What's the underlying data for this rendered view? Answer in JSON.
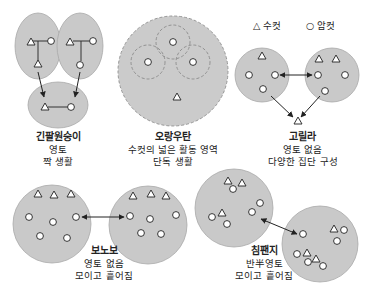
{
  "legend": {
    "male_symbol": "△",
    "male_label": "수컷",
    "female_symbol": "○",
    "female_label": "암컷"
  },
  "species": [
    {
      "name": "긴팔원숭이",
      "desc_line1": "영토",
      "desc_line2": "짝 생활"
    },
    {
      "name": "오랑우탄",
      "desc_line1": "수컷의 넓은 활동 영역",
      "desc_line2": "단독 생활"
    },
    {
      "name": "고릴라",
      "desc_line1": "영토 없음",
      "desc_line2": "다양한 집단 구성"
    },
    {
      "name": "보노보",
      "desc_line1": "영토 없음",
      "desc_line2": "모이고 흩어짐"
    },
    {
      "name": "침팬지",
      "desc_line1": "반半영토",
      "desc_line2": "모이고 흩어짐"
    }
  ],
  "colors": {
    "territory_fill": "#c9c9c9",
    "territory_stroke": "#a8a8a8",
    "symbol_stroke": "#333333",
    "text": "#222222"
  }
}
